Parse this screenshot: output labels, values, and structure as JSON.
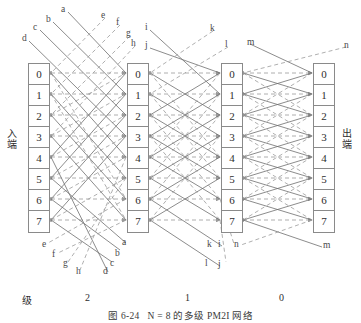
{
  "figure": {
    "caption_number": "图 6-24",
    "caption_text": "N = 8 的多级 PM2I 网络",
    "input_label": "入端",
    "output_label": "出端",
    "stage_axis_label": "级",
    "stage_labels": [
      "2",
      "1",
      "0"
    ],
    "node_ids": [
      "0",
      "1",
      "2",
      "3",
      "4",
      "5",
      "6",
      "7"
    ],
    "columns": [
      {
        "name": "input-column",
        "x": 28
      },
      {
        "name": "stage2-output-column",
        "x": 127
      },
      {
        "name": "stage1-output-column",
        "x": 221
      },
      {
        "name": "stage0-output-column",
        "x": 313
      }
    ]
  },
  "colors": {
    "line_solid": "#6e6e6e",
    "line_dashed": "#9a9a9a",
    "box_border": "#8a8a8a",
    "text": "#2e2e2e",
    "background": "#ffffff"
  },
  "wire_labels": {
    "top_left": [
      {
        "id": "a",
        "x": 61,
        "y": 4
      },
      {
        "id": "b",
        "x": 46,
        "y": 14
      },
      {
        "id": "c",
        "x": 33,
        "y": 22
      },
      {
        "id": "d",
        "x": 22,
        "y": 33
      },
      {
        "id": "e",
        "x": 101,
        "y": 10
      },
      {
        "id": "f",
        "x": 116,
        "y": 17
      },
      {
        "id": "g",
        "x": 126,
        "y": 28
      },
      {
        "id": "h",
        "x": 131,
        "y": 38
      }
    ],
    "top_right": [
      {
        "id": "i",
        "x": 145,
        "y": 22
      },
      {
        "id": "j",
        "x": 145,
        "y": 40
      },
      {
        "id": "k",
        "x": 210,
        "y": 23
      },
      {
        "id": "l",
        "x": 225,
        "y": 39
      },
      {
        "id": "m",
        "x": 247,
        "y": 37
      },
      {
        "id": "n",
        "x": 344,
        "y": 40
      }
    ],
    "bottom_left": [
      {
        "id": "e",
        "x": 42,
        "y": 239
      },
      {
        "id": "f",
        "x": 52,
        "y": 249
      },
      {
        "id": "g",
        "x": 63,
        "y": 258
      },
      {
        "id": "h",
        "x": 76,
        "y": 266
      },
      {
        "id": "a",
        "x": 122,
        "y": 237
      },
      {
        "id": "b",
        "x": 115,
        "y": 248
      },
      {
        "id": "c",
        "x": 110,
        "y": 258
      },
      {
        "id": "d",
        "x": 103,
        "y": 266
      }
    ],
    "bottom_right": [
      {
        "id": "i",
        "x": 221,
        "y": 239
      },
      {
        "id": "n",
        "x": 236,
        "y": 239
      },
      {
        "id": "k",
        "x": 230,
        "y": 239
      },
      {
        "id": "j",
        "x": 218,
        "y": 259
      },
      {
        "id": "l",
        "x": 221,
        "y": 258
      },
      {
        "id": "m",
        "x": 323,
        "y": 240
      }
    ]
  }
}
